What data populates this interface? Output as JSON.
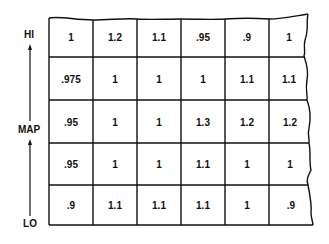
{
  "axis": {
    "label": "MAP",
    "top_label": "HI",
    "bottom_label": "LO",
    "direction": "up"
  },
  "grid": {
    "rows": 5,
    "columns": 6,
    "cells": [
      [
        "1",
        "1.2",
        "1.1",
        ".95",
        ".9",
        "1"
      ],
      [
        ".975",
        "1",
        "1",
        "1",
        "1.1",
        "1.1"
      ],
      [
        ".95",
        "1",
        "1",
        "1.3",
        "1.2",
        "1.2"
      ],
      [
        ".95",
        "1",
        "1",
        "1.1",
        "1",
        "1"
      ],
      [
        ".9",
        "1.1",
        "1.1",
        "1.1",
        "1",
        ".9"
      ]
    ]
  },
  "colors": {
    "line": "#111111",
    "text": "#111111",
    "background": "#ffffff"
  }
}
